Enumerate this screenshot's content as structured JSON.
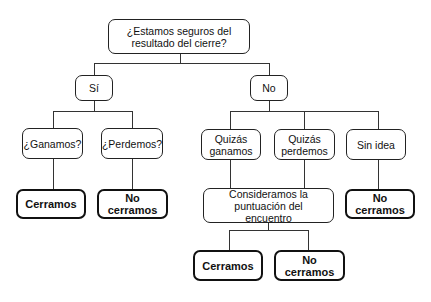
{
  "diagram": {
    "type": "decision-tree",
    "root": {
      "label": "¿Estamos seguros del resultado del cierre?"
    },
    "level1": [
      {
        "label": "Sí"
      },
      {
        "label": "No"
      }
    ],
    "si_children": [
      {
        "label": "¿Ganamos?",
        "outcome": "Cerramos"
      },
      {
        "label": "¿Perdemos?",
        "outcome": "No cerramos"
      }
    ],
    "no_children": [
      {
        "label": "Quizás ganamos"
      },
      {
        "label": "Quizás perdemos"
      },
      {
        "label": "Sin idea",
        "outcome": "No cerramos"
      }
    ],
    "consider": {
      "label": "Consideramos la puntuación del encuentro"
    },
    "consider_outcomes": [
      {
        "label": "Cerramos"
      },
      {
        "label": "No cerramos"
      }
    ]
  }
}
